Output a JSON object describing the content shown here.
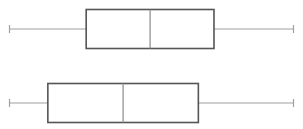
{
  "chart_data": {
    "type": "boxplot",
    "title": "",
    "xlabel": "",
    "ylabel": "",
    "orientation": "horizontal",
    "axes_visible": false,
    "grid": false,
    "legend": null,
    "xlim": [
      0,
      100
    ],
    "categories": [
      "Series 1",
      "Series 2"
    ],
    "series": [
      {
        "name": "Series 1",
        "min": 0,
        "q1": 27,
        "median": 49.5,
        "q3": 72,
        "max": 100
      },
      {
        "name": "Series 2",
        "min": 0,
        "q1": 13.5,
        "median": 40,
        "q3": 66.5,
        "max": 100
      }
    ]
  },
  "style": {
    "box_color": "#555555",
    "median_color": "#8a8a8a",
    "whisker_color": "#a0a0a0",
    "background": "#ffffff"
  }
}
